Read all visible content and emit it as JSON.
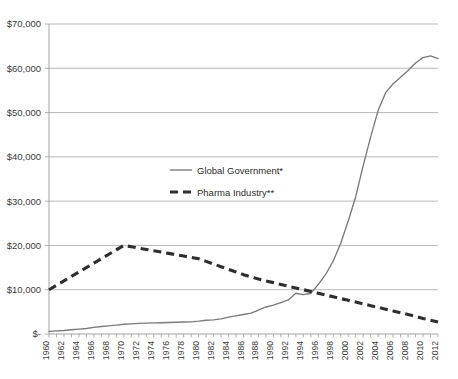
{
  "chart_data": {
    "type": "line",
    "title": "",
    "subtitle": "",
    "xlabel": "",
    "ylabel": "",
    "grid": true,
    "legend_position": "inside-upper-left",
    "xlim": [
      1960,
      2012
    ],
    "ylim": [
      0,
      70000
    ],
    "y_ticks": [
      0,
      10000,
      20000,
      30000,
      40000,
      50000,
      60000,
      70000
    ],
    "y_tick_labels": [
      "$-",
      "$10,000",
      "$20,000",
      "$30,000",
      "$40,000",
      "$50,000",
      "$60,000",
      "$70,000"
    ],
    "x_tick_labels": [
      "1960",
      "1962",
      "1964",
      "1966",
      "1968",
      "1970",
      "1972",
      "1974",
      "1976",
      "1978",
      "1980",
      "1982",
      "1984",
      "1986",
      "1988",
      "1990",
      "1992",
      "1994",
      "1996",
      "1998",
      "2000",
      "2002",
      "2004",
      "2006",
      "2008",
      "2010",
      "2012"
    ],
    "x": [
      1960,
      1961,
      1962,
      1963,
      1964,
      1965,
      1966,
      1967,
      1968,
      1969,
      1970,
      1971,
      1972,
      1973,
      1974,
      1975,
      1976,
      1977,
      1978,
      1979,
      1980,
      1981,
      1982,
      1983,
      1984,
      1985,
      1986,
      1987,
      1988,
      1989,
      1990,
      1991,
      1992,
      1993,
      1994,
      1995,
      1996,
      1997,
      1998,
      1999,
      2000,
      2001,
      2002,
      2003,
      2004,
      2005,
      2006,
      2007,
      2008,
      2009,
      2010,
      2011,
      2012
    ],
    "series": [
      {
        "name": "Global Government*",
        "style": "solid",
        "color": "#7a7a7a",
        "values": [
          600,
          700,
          800,
          950,
          1100,
          1250,
          1500,
          1700,
          1850,
          2000,
          2200,
          2300,
          2400,
          2450,
          2500,
          2550,
          2600,
          2650,
          2700,
          2750,
          2900,
          3100,
          3200,
          3400,
          3800,
          4100,
          4400,
          4700,
          5400,
          6100,
          6500,
          7100,
          7700,
          9200,
          8900,
          9200,
          11200,
          13500,
          16500,
          20500,
          25500,
          31000,
          38000,
          44500,
          50500,
          54500,
          56500,
          58000,
          59500,
          61200,
          62400,
          62800,
          62200
        ]
      },
      {
        "name": "Pharma Industry**",
        "style": "dashed",
        "color": "#2e2e2e",
        "values": [
          10000,
          11000,
          12000,
          13000,
          14000,
          15000,
          16000,
          17000,
          18000,
          19000,
          20000,
          19700,
          19400,
          19100,
          18800,
          18500,
          18200,
          17900,
          17600,
          17300,
          17000,
          16400,
          15800,
          15200,
          14600,
          14000,
          13400,
          12900,
          12400,
          12000,
          11600,
          11200,
          10800,
          10400,
          10000,
          9600,
          9200,
          8800,
          8400,
          8000,
          7600,
          7200,
          6800,
          6400,
          6000,
          5600,
          5200,
          4800,
          4400,
          4000,
          3500,
          3100,
          2700
        ]
      }
    ],
    "legend": [
      {
        "label": "Global Government*",
        "style": "solid"
      },
      {
        "label": "Pharma Industry**",
        "style": "dashed"
      }
    ]
  }
}
